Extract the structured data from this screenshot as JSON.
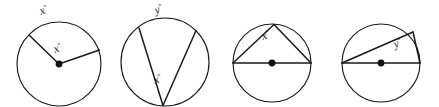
{
  "figure": {
    "background_color": "#ffffff",
    "stroke_color": "#1a1a1a",
    "dot_color": "#111111"
  },
  "diagrams": [
    {
      "id": "circle-1",
      "description": "Circle with central angle formed by two radii",
      "has_center_dot": true,
      "labels": {
        "arc_label": "x",
        "arc_degree_symbol": "°",
        "angle_label": "x",
        "angle_degree_symbol": "°"
      }
    },
    {
      "id": "circle-2",
      "description": "Circle with inscribed angle at bottom vertex subtending top arc",
      "has_center_dot": false,
      "labels": {
        "arc_label": "y",
        "arc_degree_symbol": "°",
        "angle_label": "x",
        "angle_degree_symbol": "°"
      }
    },
    {
      "id": "circle-3",
      "description": "Circle with horizontal diameter and inscribed triangle with apex at top",
      "has_center_dot": true,
      "labels": {
        "angle_label": "x",
        "angle_degree_symbol": "°"
      }
    },
    {
      "id": "circle-4",
      "description": "Circle with horizontal diameter and inscribed angle at upper right point",
      "has_center_dot": true,
      "labels": {
        "angle_label": "y",
        "angle_degree_symbol": "°"
      }
    }
  ]
}
